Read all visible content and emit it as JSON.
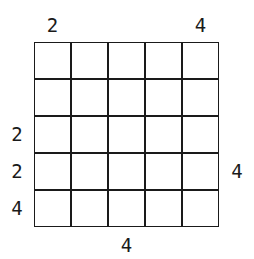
{
  "puzzle": {
    "type": "skyscrapers",
    "size": 5,
    "clues": {
      "top": [
        "2",
        "",
        "",
        "",
        "4"
      ],
      "bottom": [
        "",
        "",
        "4",
        "",
        ""
      ],
      "left": [
        "",
        "",
        "2",
        "2",
        "4"
      ],
      "right": [
        "",
        "",
        "",
        "4",
        ""
      ]
    },
    "cells": [
      [
        "",
        "",
        "",
        "",
        ""
      ],
      [
        "",
        "",
        "",
        "",
        ""
      ],
      [
        "",
        "",
        "",
        "",
        ""
      ],
      [
        "",
        "",
        "",
        "",
        ""
      ],
      [
        "",
        "",
        "",
        "",
        ""
      ]
    ]
  }
}
